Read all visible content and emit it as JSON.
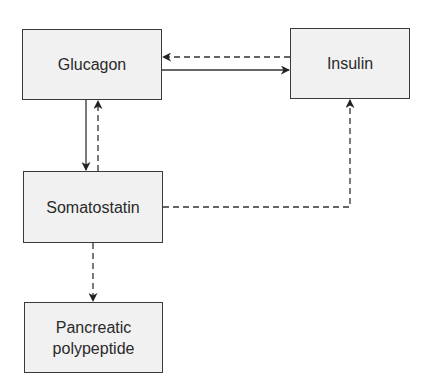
{
  "diagram": {
    "type": "flow",
    "nodes": [
      {
        "id": "glucagon",
        "label": "Glucagon"
      },
      {
        "id": "insulin",
        "label": "Insulin"
      },
      {
        "id": "somatostatin",
        "label": "Somatostatin"
      },
      {
        "id": "pancreatic_polypeptide",
        "label": "Pancreatic polypeptide",
        "lines": [
          "Pancreatic",
          "polypeptide"
        ]
      }
    ],
    "edges": [
      {
        "from": "glucagon",
        "to": "insulin",
        "style": "solid"
      },
      {
        "from": "insulin",
        "to": "glucagon",
        "style": "dashed"
      },
      {
        "from": "glucagon",
        "to": "somatostatin",
        "style": "solid"
      },
      {
        "from": "somatostatin",
        "to": "glucagon",
        "style": "dashed"
      },
      {
        "from": "somatostatin",
        "to": "insulin",
        "style": "dashed"
      },
      {
        "from": "somatostatin",
        "to": "pancreatic_polypeptide",
        "style": "dashed"
      }
    ],
    "colors": {
      "node_fill": "#f1f1f1",
      "node_border": "#3a3a3a",
      "text": "#2a2a2a",
      "line": "#333333"
    }
  }
}
